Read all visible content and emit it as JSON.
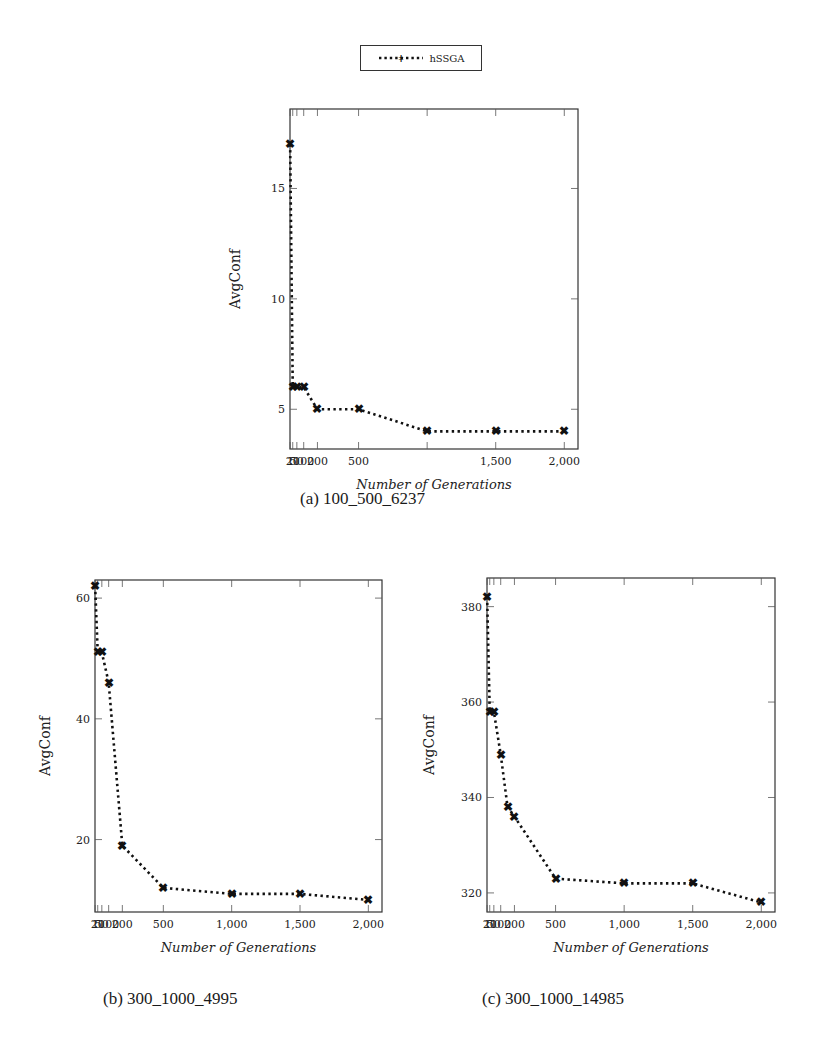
{
  "legend": {
    "label": "hSSGA"
  },
  "chart_data": [
    {
      "id": "a",
      "type": "line",
      "title": "",
      "caption": "(a) 100_500_6237",
      "xlabel": "Number of Generations",
      "ylabel": "AvgConf",
      "legend": [
        "hSSGA"
      ],
      "legend_position": "top-center",
      "grid": false,
      "x": [
        1,
        20,
        50,
        100,
        200,
        500,
        1000,
        1500,
        2000
      ],
      "series": [
        {
          "name": "hSSGA",
          "values": [
            17,
            6,
            6,
            6,
            5,
            5,
            4,
            4,
            4
          ]
        }
      ],
      "xticks": [
        "1",
        "20",
        "50",
        "100",
        "200",
        "500",
        "1,500",
        "2,000"
      ],
      "yticks": [
        "5",
        "10",
        "15"
      ],
      "xlim": [
        0,
        2100
      ],
      "ylim": [
        3.2,
        18.6
      ]
    },
    {
      "id": "b",
      "type": "line",
      "title": "",
      "caption": "(b) 300_1000_4995",
      "xlabel": "Number of Generations",
      "ylabel": "AvgConf",
      "legend": [
        "hSSGA"
      ],
      "grid": false,
      "x": [
        1,
        20,
        50,
        100,
        200,
        500,
        1000,
        1500,
        2000
      ],
      "series": [
        {
          "name": "hSSGA",
          "values": [
            62,
            51,
            51,
            46,
            19,
            12,
            11,
            11,
            10
          ]
        }
      ],
      "xticks": [
        "1",
        "20",
        "50",
        "100",
        "200",
        "500",
        "1,000",
        "1,500",
        "2,000"
      ],
      "yticks": [
        "20",
        "40",
        "60"
      ],
      "xlim": [
        0,
        2100
      ],
      "ylim": [
        8,
        63
      ]
    },
    {
      "id": "c",
      "type": "line",
      "title": "",
      "caption": "(c) 300_1000_14985",
      "xlabel": "Number of Generations",
      "ylabel": "AvgConf",
      "legend": [
        "hSSGA"
      ],
      "grid": false,
      "x": [
        1,
        20,
        50,
        100,
        200,
        500,
        1000,
        1500,
        2000
      ],
      "series": [
        {
          "name": "hSSGA",
          "values": [
            382,
            358,
            358,
            349,
            338,
            336,
            323,
            322,
            322,
            318
          ]
        }
      ],
      "x_full": [
        1,
        20,
        50,
        100,
        150,
        200,
        500,
        1000,
        1500,
        2000
      ],
      "xticks": [
        "1",
        "20",
        "50",
        "100",
        "200",
        "500",
        "1,000",
        "1,500",
        "2,000"
      ],
      "yticks": [
        "320",
        "340",
        "360",
        "380"
      ],
      "xlim": [
        0,
        2100
      ],
      "ylim": [
        316,
        386
      ]
    }
  ],
  "captions": {
    "a": "(a) 100_500_6237",
    "b": "(b) 300_1000_4995",
    "c": "(c) 300_1000_14985"
  },
  "axis": {
    "xlabel": "Number of Generations",
    "ylabel": "AvgConf"
  }
}
